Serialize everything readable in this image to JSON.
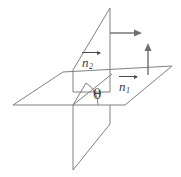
{
  "figure": {
    "background_color": "#ffffff",
    "line_color": "#808080",
    "text_color": "#3a3a3a",
    "width": 181,
    "height": 177,
    "labels": {
      "n2": {
        "base": "n",
        "subscript": "2",
        "vector_arrow": true
      },
      "n1": {
        "base": "n",
        "subscript": "1",
        "vector_arrow": true
      },
      "theta": {
        "symbol": "θ"
      }
    },
    "arrows": {
      "horizontal_arrow": {
        "direction": "right",
        "from_x": 110,
        "from_y": 33,
        "to_x": 140,
        "to_y": 33
      },
      "vertical_arrow": {
        "direction": "up",
        "from_x": 148,
        "from_y": 74,
        "to_x": 148,
        "to_y": 44
      }
    },
    "shapes": {
      "horizontal_plane": "13,105 63,72 172,66 125,105",
      "vertical_plane_upper": "73,70 110,8 110,92 73,92",
      "vertical_plane_lower": "73,105 110,105 110,124 73,170",
      "angle_arc_radius": 22,
      "angle_value_degrees": 55
    }
  }
}
